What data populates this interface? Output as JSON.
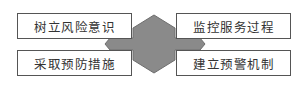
{
  "diagram": {
    "center_shape": "hexagon-with-arrows",
    "center_color": "#8a8a8a",
    "boxes": [
      {
        "label": "树立风险意识",
        "position": "top-left"
      },
      {
        "label": "监控服务过程",
        "position": "top-right"
      },
      {
        "label": "采取预防措施",
        "position": "bottom-left"
      },
      {
        "label": "建立预警机制",
        "position": "bottom-right"
      }
    ]
  }
}
